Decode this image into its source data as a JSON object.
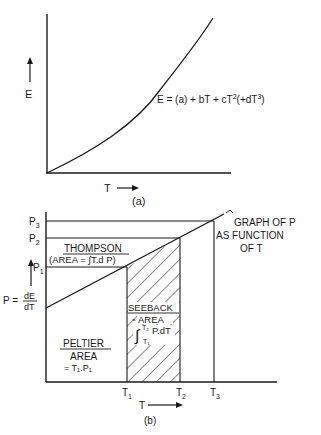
{
  "figure_a": {
    "y_label": "E",
    "x_label": "T",
    "equation": {
      "lhs": "E = ",
      "a": "(a)",
      "b": " + bT + cT",
      "sq": "2",
      "c": "(+dT",
      "cube": "3",
      "close": ")"
    },
    "caption": "(a)"
  },
  "figure_b": {
    "y_levels": [
      "P",
      "P",
      "P"
    ],
    "y_level_subs": [
      "3",
      "2",
      "1"
    ],
    "p_def": {
      "lhs": "P =",
      "num": "dE",
      "den": "dT"
    },
    "x_ticks": [
      "T",
      "T",
      "T"
    ],
    "x_tick_subs": [
      "1",
      "2",
      "3"
    ],
    "x_label": "T",
    "thompson": {
      "title": "THOMPSON",
      "formula": "(AREA = ∫T.d P)"
    },
    "seeback": {
      "title": "SEEBACK",
      "area": "AREA",
      "integral": "∫",
      "upper": "T₂",
      "lower": "T₁",
      "body": "P.dT"
    },
    "peltier": {
      "title": "PELTIER",
      "area": "AREA",
      "formula": "= T₁.P₁"
    },
    "annotation": [
      "GRAPH OF P",
      "AS FUNCTION",
      "OF T"
    ],
    "caption": "(b)"
  },
  "colors": {
    "ink": "#1a1a1a",
    "paper": "#ffffff"
  }
}
